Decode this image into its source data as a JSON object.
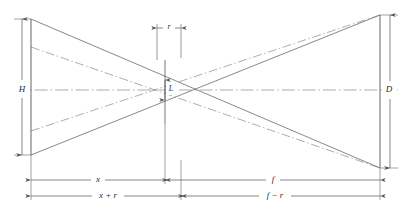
{
  "diagram": {
    "kind": "optical-ray-geometry-diagram",
    "title": "",
    "background_color": "#ffffff",
    "line_color": "#555555",
    "dash_color": "#777777",
    "text_color": "#2b2b2b",
    "labels": {
      "left_height": "H",
      "right_height": "D",
      "center_height": "L",
      "top_gap": "r",
      "bottom_left_upper": "x",
      "bottom_right_upper": "f",
      "bottom_left_lower": "x + r",
      "bottom_right_lower": "f − r"
    },
    "geometry": {
      "left_plane_x": 31,
      "left_plane_top_y": 19,
      "left_plane_bottom_y": 155,
      "right_plane_x": 380,
      "right_plane_top_y": 15,
      "right_plane_bottom_y": 168,
      "crossing_solid_x": 165,
      "crossing_dash_x": 148,
      "axis_y": 90,
      "center_upper_y": 80,
      "center_lower_y": 100,
      "gap_left_x": 157,
      "gap_right_x": 181,
      "dim_row1_y": 180,
      "dim_row2_y": 196
    }
  }
}
